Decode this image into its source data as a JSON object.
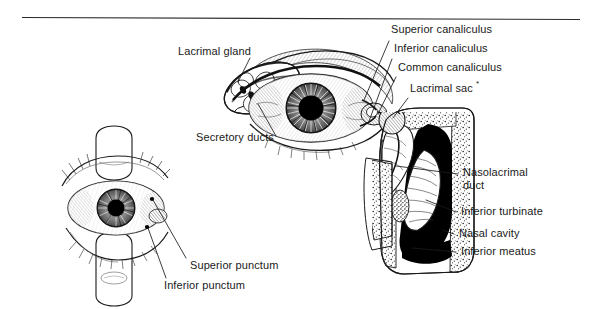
{
  "figure": {
    "background_color": "#ffffff",
    "ink_color": "#1a1a1a",
    "top_rule": {
      "x1": 22,
      "y": 17,
      "x2": 580
    }
  },
  "labels": {
    "lacrimal_gland": "Lacrimal gland",
    "secretory_ducts": "Secretory ducts",
    "superior_canaliculus": "Superior canaliculus",
    "inferior_canaliculus": "Inferior canaliculus",
    "common_canaliculus": "Common canaliculus",
    "lacrimal_sac": "Lacrimal sac",
    "lacrimal_sac_marker": "*",
    "nasolacrimal_duct": "Nasolacrimal duct",
    "inferior_turbinate": "Inferior turbinate",
    "nasal_cavity": "Nasal cavity",
    "inferior_meatus": "Inferior meatus",
    "superior_punctum": "Superior punctum",
    "inferior_punctum": "Inferior punctum"
  },
  "panels": {
    "main_eye": "Anterior view of right eye with lacrimal gland and canaliculi",
    "nasal_section": "Coronal section through nasal cavity showing nasolacrimal duct",
    "lower_eye": "Eyelids retracted by fingers to expose superior and inferior puncta"
  }
}
